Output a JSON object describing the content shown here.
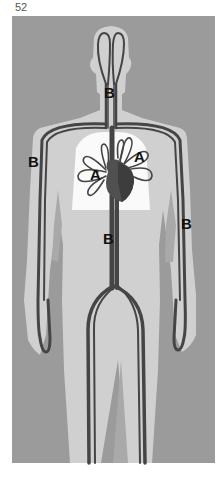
{
  "page": {
    "number": "52"
  },
  "diagram": {
    "colors": {
      "background": "#9b9b9b",
      "body": "#d0d0d0",
      "lungs": "#fafafa",
      "vessels": "#454545",
      "heart": "#505050",
      "shadow": "#a9a9a9"
    },
    "labels": [
      {
        "id": "neck",
        "text": "B",
        "x": 110,
        "y": 100
      },
      {
        "id": "left-arm",
        "text": "B",
        "x": 31,
        "y": 167
      },
      {
        "id": "left-lung",
        "text": "A",
        "x": 92,
        "y": 179
      },
      {
        "id": "right-lung",
        "text": "A",
        "x": 136,
        "y": 162
      },
      {
        "id": "right-arm",
        "text": "B",
        "x": 184,
        "y": 229
      },
      {
        "id": "abdomen",
        "text": "B",
        "x": 105,
        "y": 243
      }
    ]
  }
}
